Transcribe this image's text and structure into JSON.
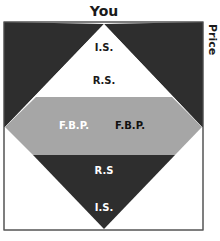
{
  "diagram": {
    "title": "You",
    "side_axis_label": "Price",
    "colors": {
      "dark": "#2e2e2e",
      "gray": "#a6a6a6",
      "white": "#ffffff",
      "border": "#555555"
    },
    "regions": {
      "upper_triangle": {
        "labels": [
          "I.S.",
          "R.S."
        ]
      },
      "middle_band": {
        "labels": [
          "F.B.P.",
          "F.B.P."
        ]
      },
      "lower_triangle": {
        "labels": [
          "R.S",
          "I.S."
        ]
      }
    }
  }
}
